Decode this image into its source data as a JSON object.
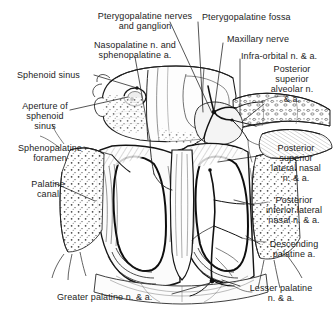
{
  "figure": {
    "background_color": "#ffffff",
    "ink_color": "#1c1c1c",
    "width": 334,
    "height": 313
  },
  "labels": [
    {
      "id": "pterygopalatine-nerves-ganglion",
      "text": "Pterygopalatine nerves\nand ganglion",
      "x": 86,
      "y": 11,
      "align": "center",
      "w": 118
    },
    {
      "id": "pterygopalatine-fossa",
      "text": "Pterygopalatine fossa",
      "x": 202,
      "y": 12,
      "align": "left",
      "w": 100
    },
    {
      "id": "nasopalatine-sphenopalatine",
      "text": "Nasopalatine n. and\nsphenopalatine a.",
      "x": 80,
      "y": 40,
      "align": "center",
      "w": 110
    },
    {
      "id": "maxillary-nerve",
      "text": "Maxillary nerve",
      "x": 227,
      "y": 34,
      "align": "left",
      "w": 80
    },
    {
      "id": "infra-orbital",
      "text": "Infra-orbital n. & a.",
      "x": 241,
      "y": 51,
      "align": "left",
      "w": 90
    },
    {
      "id": "sphenoid-sinus",
      "text": "Sphenoid sinus",
      "x": 17,
      "y": 70,
      "align": "left",
      "w": 74
    },
    {
      "id": "posterior-superior-alveolar",
      "text": "Posterior\nsuperior\nalveolar n.\n& a.",
      "x": 258,
      "y": 64,
      "align": "center",
      "w": 68
    },
    {
      "id": "aperture-of-sphenoid-sinus",
      "text": "Aperture of\nsphenoid\nsinus",
      "x": 13,
      "y": 101,
      "align": "center",
      "w": 64
    },
    {
      "id": "sphenopalatine-foramen",
      "text": "Sphenopalatine\nforamen",
      "x": 12,
      "y": 143,
      "align": "center",
      "w": 76
    },
    {
      "id": "posterior-superior-lateral-nasal",
      "text": "Posterior\nsuperior\nlateral nasal\nn. & a.",
      "x": 262,
      "y": 143,
      "align": "center",
      "w": 68
    },
    {
      "id": "palatine-canal",
      "text": "Palatine\ncanal",
      "x": 22,
      "y": 179,
      "align": "center",
      "w": 52
    },
    {
      "id": "posterior-inferior-lateral-nasal",
      "text": "Posterior\ninferior lateral\nnasal n. & a.",
      "x": 258,
      "y": 195,
      "align": "center",
      "w": 72
    },
    {
      "id": "descending-palatine",
      "text": "Descending\npalatine a.",
      "x": 262,
      "y": 239,
      "align": "center",
      "w": 64
    },
    {
      "id": "lesser-palatine",
      "text": "Lesser palatine\nn. & a.",
      "x": 241,
      "y": 283,
      "align": "center",
      "w": 80
    },
    {
      "id": "greater-palatine",
      "text": "Greater palatine n. & a.",
      "x": 57,
      "y": 292,
      "align": "left",
      "w": 114
    }
  ],
  "leader_lines": [
    {
      "id": "leader-pterygopalatine-nerves-ganglion",
      "from": [
        170,
        22
      ],
      "to": [
        212,
        113
      ]
    },
    {
      "id": "leader-pterygopalatine-fossa",
      "from": [
        198,
        22
      ],
      "to": [
        203,
        112
      ]
    },
    {
      "id": "leader-nasopalatine-sphenopalatine",
      "from": [
        135,
        57
      ],
      "to": [
        150,
        140
      ]
    },
    {
      "id": "leader-maxillary-nerve",
      "from": [
        223,
        43
      ],
      "to": [
        214,
        112
      ]
    },
    {
      "id": "leader-infra-orbital",
      "from": [
        240,
        59
      ],
      "to": [
        240,
        115
      ]
    },
    {
      "id": "leader-sphenoid-sinus",
      "from": [
        94,
        75
      ],
      "to": [
        137,
        88
      ]
    },
    {
      "id": "leader-posterior-superior-alveolar",
      "from": [
        264,
        104
      ],
      "to": [
        243,
        121
      ]
    },
    {
      "id": "leader-aperture-sphenoid",
      "from": [
        70,
        110
      ],
      "to": [
        128,
        97
      ]
    },
    {
      "id": "leader-sphenopalatine-foramen",
      "from": [
        84,
        147
      ],
      "to": [
        112,
        155
      ]
    },
    {
      "id": "leader-posterior-superior-lateral-nasal",
      "from": [
        258,
        156
      ],
      "to": [
        218,
        162
      ]
    },
    {
      "id": "leader-palatine-canal",
      "from": [
        54,
        183
      ],
      "to": [
        95,
        201
      ]
    },
    {
      "id": "leader-posterior-inferior-lateral-nasal",
      "from": [
        254,
        205
      ],
      "to": [
        234,
        200
      ]
    },
    {
      "id": "leader-descending-palatine",
      "from": [
        260,
        244
      ],
      "to": [
        246,
        236
      ]
    },
    {
      "id": "leader-lesser-palatine",
      "from": [
        240,
        286
      ],
      "to": [
        222,
        280
      ]
    },
    {
      "id": "leader-greater-palatine",
      "from": [
        172,
        294
      ],
      "to": [
        210,
        283
      ]
    }
  ]
}
